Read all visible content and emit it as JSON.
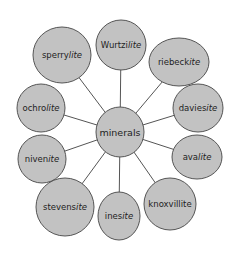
{
  "diagram": {
    "type": "mind-map",
    "colors": {
      "node_fill": "#c2c2c2",
      "node_stroke": "#555555",
      "edge": "#555555",
      "text": "#1e1e1e",
      "background": "#ffffff"
    },
    "center": {
      "label": "minerals",
      "cx": 120,
      "cy": 132,
      "rx": 24,
      "ry": 25
    },
    "nodes": [
      {
        "id": "wurtzilite",
        "base": "Wurtzi",
        "suffix": "lite",
        "cx": 121,
        "cy": 45,
        "rx": 25,
        "ry": 25
      },
      {
        "id": "riebeckite",
        "base": "riebeck",
        "suffix": "ite",
        "cx": 179,
        "cy": 62,
        "rx": 30,
        "ry": 24
      },
      {
        "id": "daviesite",
        "base": "davies",
        "suffix": "ite",
        "cx": 198,
        "cy": 108,
        "rx": 25,
        "ry": 24
      },
      {
        "id": "avalite",
        "base": "ava",
        "suffix": "lite",
        "cx": 197,
        "cy": 157,
        "rx": 25,
        "ry": 22
      },
      {
        "id": "knoxvillite",
        "base": "knoxvillite",
        "suffix": "",
        "cx": 170,
        "cy": 204,
        "rx": 26,
        "ry": 26
      },
      {
        "id": "inesite",
        "base": "ines",
        "suffix": "ite",
        "cx": 119,
        "cy": 216,
        "rx": 21,
        "ry": 24
      },
      {
        "id": "stevensite",
        "base": "stevens",
        "suffix": "ite",
        "cx": 65,
        "cy": 207,
        "rx": 29,
        "ry": 29
      },
      {
        "id": "nivenite",
        "base": "niven",
        "suffix": "ite",
        "cx": 42,
        "cy": 159,
        "rx": 24,
        "ry": 24
      },
      {
        "id": "ochrolite",
        "base": "ochro",
        "suffix": "lite",
        "cx": 41,
        "cy": 108,
        "rx": 24,
        "ry": 24
      },
      {
        "id": "sperrylite",
        "base": "sperry",
        "suffix": "lite",
        "cx": 62,
        "cy": 55,
        "rx": 29,
        "ry": 28
      }
    ]
  }
}
